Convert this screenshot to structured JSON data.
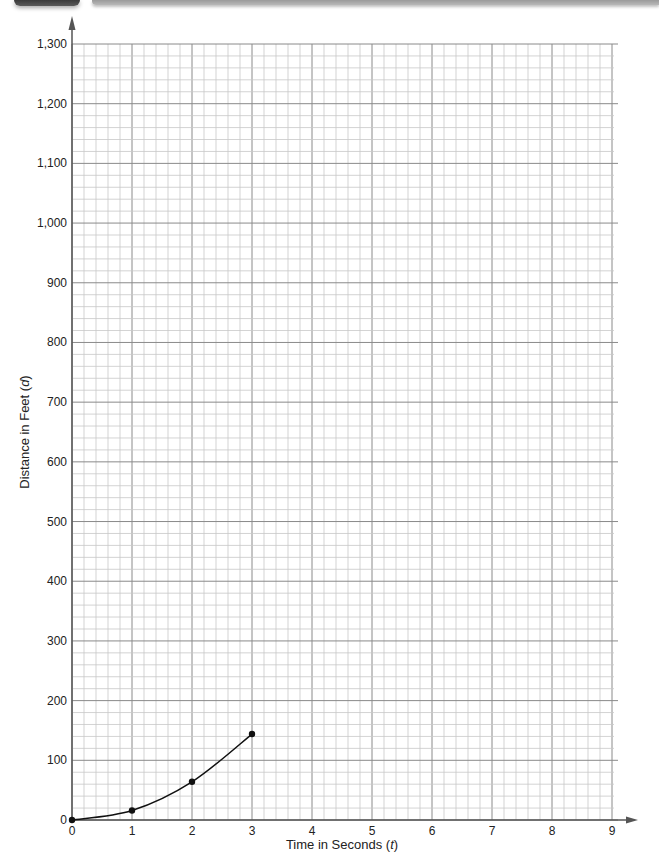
{
  "chart_data": {
    "type": "line",
    "title": "",
    "xlabel": "Time in Seconds",
    "xlabel_var": "t",
    "ylabel": "Distance in Feet",
    "ylabel_var": "d",
    "xlim": [
      0,
      9
    ],
    "ylim": [
      0,
      1300
    ],
    "x_ticks": [
      0,
      1,
      2,
      3,
      4,
      5,
      6,
      7,
      8,
      9
    ],
    "y_ticks": [
      0,
      100,
      200,
      300,
      400,
      500,
      600,
      700,
      800,
      900,
      1000,
      1100,
      1200,
      1300
    ],
    "y_tick_labels": [
      "0",
      "100",
      "200",
      "300",
      "400",
      "500",
      "600",
      "700",
      "800",
      "900",
      "1,000",
      "1,100",
      "1,200",
      "1,300"
    ],
    "x_minor_step": 0.2,
    "y_minor_step": 20,
    "grid": true,
    "legend": null,
    "series": [
      {
        "name": "distance",
        "x": [
          0,
          1,
          2,
          3
        ],
        "values": [
          0,
          16,
          64,
          144
        ],
        "markers": true,
        "smooth": true
      }
    ]
  },
  "labels": {
    "x_axis": "Time in Seconds (",
    "x_var": "t",
    "x_close": ")",
    "y_axis": "Distance in Feet (",
    "y_var": "d",
    "y_close": ")"
  },
  "colors": {
    "grid_minor": "#c8c8c8",
    "grid_major": "#8a8a8a",
    "axis": "#555555",
    "line": "#111111"
  }
}
